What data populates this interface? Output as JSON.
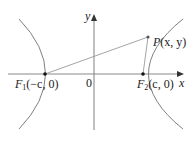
{
  "diagram": {
    "type": "hyperbola-foci",
    "axes": {
      "x_label": "x",
      "y_label": "y",
      "origin_label": "0"
    },
    "points": {
      "F1": {
        "name": "F",
        "sub": "1",
        "coords": "(−c, 0)"
      },
      "F2": {
        "name": "F",
        "sub": "2",
        "coords": "(c, 0)"
      },
      "P": {
        "name": "P",
        "coords": "(x, y)"
      }
    },
    "colors": {
      "curve": "#808080",
      "axis": "#888888",
      "line": "#999999",
      "point": "#111111"
    }
  }
}
